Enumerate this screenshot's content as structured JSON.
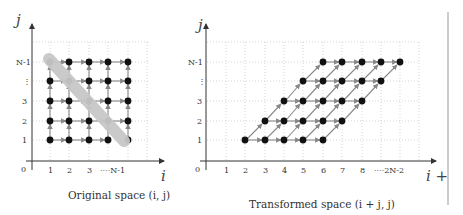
{
  "left_panel": {
    "caption": "Original space (i, j)",
    "x_axis_label": "i",
    "y_axis_label": "j",
    "origin_label": "0",
    "x_ticks": [
      "1",
      "2",
      "3",
      "····N-1"
    ],
    "y_ticks": [
      "1",
      "2",
      "3",
      "⋮",
      "N-1"
    ],
    "grid": "dotted",
    "points_description": "N-1 × N-1 grid of iteration points with horizontal (i) and vertical (j) dependence arrows; grey band highlights an anti-diagonal wavefront",
    "wavefront_color": "#c8c8c8"
  },
  "right_panel": {
    "caption": "Transformed space (i + j, j)",
    "x_axis_label": "i +",
    "y_axis_label": "j",
    "origin_label": "0",
    "x_ticks": [
      "1",
      "2",
      "3",
      "4",
      "5",
      "6",
      "7",
      "8",
      "····2N-2"
    ],
    "y_ticks": [
      "1",
      "2",
      "3",
      "⋮",
      "N-1"
    ],
    "grid": "dotted",
    "points_description": "Skewed parallelogram of iteration points; horizontal arrows along rows and diagonal arrows between rows"
  },
  "colors": {
    "point": "#111111",
    "arrow": "#888888",
    "axis": "#333333",
    "grid": "#bbbbbb",
    "divider": "#999999"
  }
}
